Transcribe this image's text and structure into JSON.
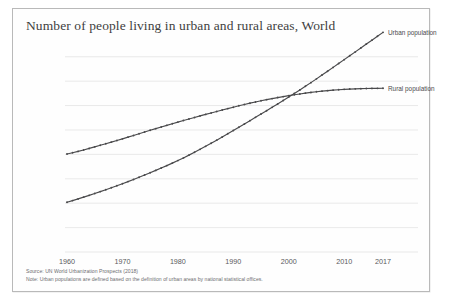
{
  "card": {
    "title": "Number of people living in urban and rural areas, World"
  },
  "footer": {
    "source": "Source: UN World Urbanization Prospects (2018)",
    "note": "Note: Urban populations are defined based on the definition of urban areas by national statistical offices."
  },
  "colors": {
    "line": "#4a4a4c",
    "grid": "#e3e3e3",
    "axis_text": "#59595b",
    "title_text": "#3f3f3f",
    "frame": "#b9b9b9",
    "background": "#fefefe"
  },
  "chart_data": {
    "type": "line",
    "title": "Number of people living in urban and rural areas, World",
    "xlabel": "",
    "ylabel": "",
    "xlim": [
      1960,
      2017
    ],
    "ylim": [
      0,
      4200000000
    ],
    "grid": true,
    "legend_position": "right-of-line-ends",
    "y_tick_labels": [
      "0",
      "500 million",
      "1 billion",
      "1.5 billion",
      "2 billion",
      "2.5 billion",
      "3 billion",
      "3.5 billion",
      "4 billion"
    ],
    "y_tick_values": [
      0,
      500000000,
      1000000000,
      1500000000,
      2000000000,
      2500000000,
      3000000000,
      3500000000,
      4000000000
    ],
    "x_tick_labels": [
      "1960",
      "1970",
      "1980",
      "1990",
      "2000",
      "2010",
      "2017"
    ],
    "x_tick_values": [
      1960,
      1970,
      1980,
      1990,
      2000,
      2010,
      2017
    ],
    "x": [
      1960,
      1961,
      1962,
      1963,
      1964,
      1965,
      1966,
      1967,
      1968,
      1969,
      1970,
      1971,
      1972,
      1973,
      1974,
      1975,
      1976,
      1977,
      1978,
      1979,
      1980,
      1981,
      1982,
      1983,
      1984,
      1985,
      1986,
      1987,
      1988,
      1989,
      1990,
      1991,
      1992,
      1993,
      1994,
      1995,
      1996,
      1997,
      1998,
      1999,
      2000,
      2001,
      2002,
      2003,
      2004,
      2005,
      2006,
      2007,
      2008,
      2009,
      2010,
      2011,
      2012,
      2013,
      2014,
      2015,
      2016,
      2017
    ],
    "series": [
      {
        "name": "Urban population",
        "label": "Urban population",
        "marker": "dot",
        "values": [
          1019000000,
          1053000000,
          1088000000,
          1124000000,
          1161000000,
          1198000000,
          1237000000,
          1276000000,
          1316000000,
          1357000000,
          1399000000,
          1442000000,
          1486000000,
          1531000000,
          1577000000,
          1624000000,
          1672000000,
          1720000000,
          1770000000,
          1821000000,
          1873000000,
          1928000000,
          1985000000,
          2043000000,
          2103000000,
          2165000000,
          2228000000,
          2292000000,
          2357000000,
          2422000000,
          2489000000,
          2556000000,
          2623000000,
          2691000000,
          2759000000,
          2827000000,
          2895000000,
          2964000000,
          3033000000,
          3103000000,
          3174000000,
          3247000000,
          3320000000,
          3395000000,
          3470000000,
          3547000000,
          3625000000,
          3703000000,
          3782000000,
          3861000000,
          3941000000,
          4021000000,
          4100000000,
          4180000000,
          4260000000,
          4340000000,
          4420000000,
          4500000000
        ]
      },
      {
        "name": "Rural population",
        "label": "Rural population",
        "marker": "dot",
        "values": [
          2008000000,
          2033000000,
          2061000000,
          2091000000,
          2122000000,
          2154000000,
          2186000000,
          2219000000,
          2252000000,
          2285000000,
          2318000000,
          2353000000,
          2388000000,
          2423000000,
          2458000000,
          2493000000,
          2527000000,
          2561000000,
          2595000000,
          2628000000,
          2661000000,
          2693000000,
          2725000000,
          2757000000,
          2788000000,
          2819000000,
          2849000000,
          2879000000,
          2909000000,
          2938000000,
          2967000000,
          2996000000,
          3023000000,
          3049000000,
          3074000000,
          3098000000,
          3121000000,
          3143000000,
          3164000000,
          3184000000,
          3203000000,
          3221000000,
          3238000000,
          3254000000,
          3269000000,
          3283000000,
          3295000000,
          3306000000,
          3316000000,
          3325000000,
          3332000000,
          3338000000,
          3343000000,
          3347000000,
          3350000000,
          3352000000,
          3353000000,
          3354000000
        ]
      }
    ],
    "annotations": [
      {
        "text": "Urban population",
        "at_x": 2017,
        "placement": "right"
      },
      {
        "text": "Rural population",
        "at_x": 2017,
        "placement": "right"
      }
    ]
  }
}
